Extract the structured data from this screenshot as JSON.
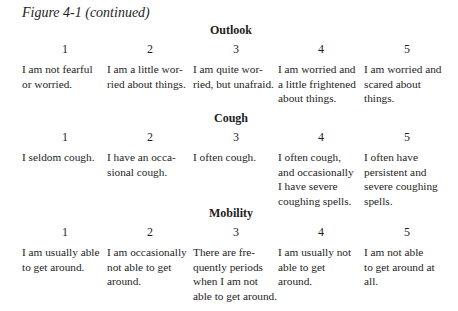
{
  "title": "Figure 4-1 (continued)",
  "sections": [
    {
      "heading": "Outlook",
      "items": [
        {
          "num": "1",
          "text": "I am not fearful\nor worried."
        },
        {
          "num": "2",
          "text": "I am a little wor-\nried about things."
        },
        {
          "num": "3",
          "text": "I am quite wor-\nried, but unafraid."
        },
        {
          "num": "4",
          "text": "I am worried and\na little frightened\nabout things."
        },
        {
          "num": "5",
          "text": "I am worried and\nscared about\nthings."
        }
      ]
    },
    {
      "heading": "Cough",
      "items": [
        {
          "num": "1",
          "text": "I seldom cough."
        },
        {
          "num": "2",
          "text": "I have an occa-\nsional cough."
        },
        {
          "num": "3",
          "text": "I often cough."
        },
        {
          "num": "4",
          "text": "I often cough,\nand occasionally\nI have severe\ncoughing spells."
        },
        {
          "num": "5",
          "text": "I often have\npersistent and\nsevere coughing\nspells."
        }
      ]
    },
    {
      "heading": "Mobility",
      "items": [
        {
          "num": "1",
          "text": "I am usually able\nto get around."
        },
        {
          "num": "2",
          "text": "I am occasionally\nnot able to get\naround."
        },
        {
          "num": "3",
          "text": "There are fre-\nquently periods\nwhen I am not\nable to get around."
        },
        {
          "num": "4",
          "text": "I am usually not\nable to get\naround."
        },
        {
          "num": "5",
          "text": "I am not able\nto get around at\nall."
        }
      ]
    }
  ]
}
